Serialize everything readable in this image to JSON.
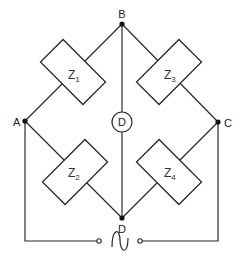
{
  "diagram": {
    "title": "",
    "type": "AC bridge circuit",
    "nodes": [
      {
        "id": "A",
        "label": "A"
      },
      {
        "id": "B",
        "label": "B"
      },
      {
        "id": "C",
        "label": "C"
      },
      {
        "id": "D",
        "label": "D"
      }
    ],
    "impedances": [
      {
        "id": "Z1",
        "base": "Z",
        "sub": "1",
        "between": [
          "A",
          "B"
        ]
      },
      {
        "id": "Z2",
        "base": "Z",
        "sub": "2",
        "between": [
          "A",
          "D"
        ]
      },
      {
        "id": "Z3",
        "base": "Z",
        "sub": "3",
        "between": [
          "B",
          "C"
        ]
      },
      {
        "id": "Z4",
        "base": "Z",
        "sub": "4",
        "between": [
          "C",
          "D"
        ]
      }
    ],
    "detector": {
      "label": "D",
      "between": [
        "B",
        "D"
      ]
    },
    "source": {
      "symbol": "~",
      "type": "AC source",
      "between": [
        "A",
        "C"
      ]
    }
  }
}
